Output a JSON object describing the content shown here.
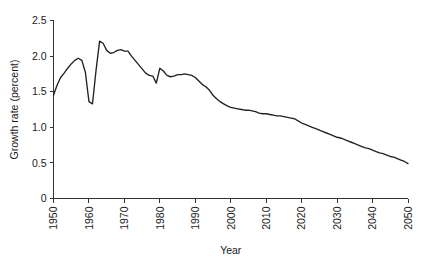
{
  "chart_data": {
    "type": "line",
    "title": "",
    "xlabel": "Year",
    "ylabel": "Growth rate (percent)",
    "xlim": [
      1950,
      2050
    ],
    "ylim": [
      0,
      2.5
    ],
    "grid": false,
    "legend": "none",
    "line_color": "#222222",
    "background_color": "#ffffff",
    "axis_color": "#333333",
    "xticks": [
      1950,
      1960,
      1970,
      1980,
      1990,
      2000,
      2010,
      2020,
      2030,
      2040,
      2050
    ],
    "xticklabels": [
      "1950",
      "1960",
      "1970",
      "1980",
      "1990",
      "2000",
      "2010",
      "2020",
      "2030",
      "2040",
      "2050"
    ],
    "xtick_rotation": 90,
    "yticks": [
      0,
      0.5,
      1.0,
      1.5,
      2.0,
      2.5
    ],
    "yticklabels": [
      "0",
      "0.5",
      "1.0",
      "1.5",
      "2.0",
      "2.5"
    ],
    "series": [
      {
        "name": "World population growth rate",
        "x": [
          1950,
          1951,
          1952,
          1953,
          1954,
          1955,
          1956,
          1957,
          1958,
          1959,
          1960,
          1961,
          1962,
          1963,
          1964,
          1965,
          1966,
          1967,
          1968,
          1969,
          1970,
          1971,
          1972,
          1973,
          1974,
          1975,
          1976,
          1977,
          1978,
          1979,
          1980,
          1981,
          1982,
          1983,
          1984,
          1985,
          1986,
          1987,
          1988,
          1989,
          1990,
          1991,
          1992,
          1993,
          1994,
          1995,
          1996,
          1997,
          1998,
          1999,
          2000,
          2001,
          2002,
          2003,
          2004,
          2005,
          2006,
          2007,
          2008,
          2009,
          2010,
          2011,
          2012,
          2013,
          2014,
          2015,
          2016,
          2017,
          2018,
          2019,
          2020,
          2021,
          2022,
          2023,
          2024,
          2025,
          2026,
          2027,
          2028,
          2029,
          2030,
          2031,
          2032,
          2033,
          2034,
          2035,
          2036,
          2037,
          2038,
          2039,
          2040,
          2041,
          2042,
          2043,
          2044,
          2045,
          2046,
          2047,
          2048,
          2049,
          2050
        ],
        "values": [
          1.45,
          1.59,
          1.7,
          1.76,
          1.83,
          1.89,
          1.94,
          1.97,
          1.94,
          1.77,
          1.36,
          1.33,
          1.8,
          2.21,
          2.18,
          2.08,
          2.04,
          2.05,
          2.08,
          2.09,
          2.07,
          2.07,
          2.0,
          1.94,
          1.88,
          1.82,
          1.76,
          1.73,
          1.72,
          1.62,
          1.83,
          1.79,
          1.73,
          1.71,
          1.72,
          1.74,
          1.74,
          1.75,
          1.74,
          1.73,
          1.7,
          1.65,
          1.6,
          1.57,
          1.52,
          1.45,
          1.4,
          1.36,
          1.33,
          1.3,
          1.28,
          1.27,
          1.26,
          1.25,
          1.24,
          1.24,
          1.23,
          1.22,
          1.2,
          1.19,
          1.19,
          1.18,
          1.17,
          1.16,
          1.16,
          1.15,
          1.14,
          1.13,
          1.12,
          1.09,
          1.06,
          1.04,
          1.02,
          1.0,
          0.98,
          0.96,
          0.94,
          0.92,
          0.9,
          0.88,
          0.86,
          0.85,
          0.83,
          0.81,
          0.79,
          0.77,
          0.75,
          0.73,
          0.71,
          0.7,
          0.68,
          0.66,
          0.64,
          0.63,
          0.61,
          0.59,
          0.58,
          0.56,
          0.54,
          0.52,
          0.49
        ]
      }
    ]
  }
}
